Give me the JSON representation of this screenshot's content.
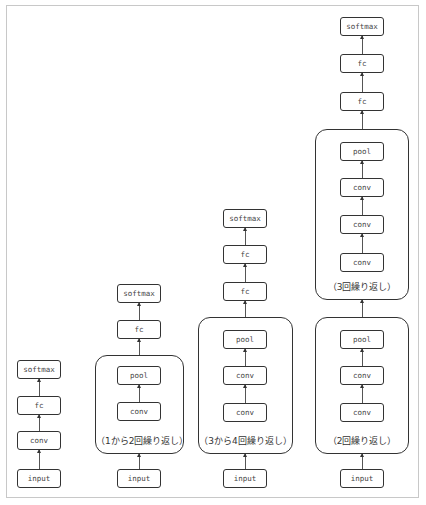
{
  "diagram": {
    "columns": [
      {
        "id": "col1",
        "layers": [
          "input",
          "conv",
          "fc",
          "softmax"
        ],
        "groups": []
      },
      {
        "id": "col2",
        "layers": [
          "input",
          "conv",
          "pool",
          "fc",
          "softmax"
        ],
        "groups": [
          {
            "contains": [
              "conv",
              "pool"
            ],
            "label": "（1から2回繰り返し）"
          }
        ]
      },
      {
        "id": "col3",
        "layers": [
          "input",
          "conv",
          "conv",
          "pool",
          "fc",
          "fc",
          "softmax"
        ],
        "groups": [
          {
            "contains": [
              "conv",
              "conv",
              "pool"
            ],
            "label": "（3から4回繰り返し）"
          }
        ]
      },
      {
        "id": "col4",
        "layers": [
          "input",
          "conv",
          "conv",
          "pool",
          "conv",
          "conv",
          "conv",
          "pool",
          "fc",
          "fc",
          "softmax"
        ],
        "groups": [
          {
            "contains": [
              "conv",
              "conv",
              "pool"
            ],
            "label": "（2回繰り返し）"
          },
          {
            "contains": [
              "conv",
              "conv",
              "conv",
              "pool"
            ],
            "label": "（3回繰り返し）"
          }
        ]
      }
    ]
  },
  "labels": {
    "input": "input",
    "conv": "conv",
    "pool": "pool",
    "fc": "fc",
    "softmax": "softmax",
    "g2": "（1から2回繰り返し）",
    "g3": "（3から4回繰り返し）",
    "g4a": "（2回繰り返し）",
    "g4b": "（3回繰り返し）"
  },
  "colors": {
    "stroke": "#333333",
    "frame": "#c8c8c8",
    "text": "#444444"
  }
}
